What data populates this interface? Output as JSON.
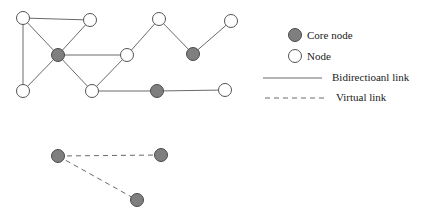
{
  "diagram": {
    "colors": {
      "core_fill": "#7f7f7f",
      "core_stroke": "#4a4a4a",
      "node_fill": "#ffffff",
      "node_stroke": "#555555",
      "link": "#6a6a6a"
    },
    "nodes": [
      {
        "id": "n1",
        "type": "node",
        "x": 23,
        "y": 18
      },
      {
        "id": "n2",
        "type": "node",
        "x": 90,
        "y": 20
      },
      {
        "id": "c1",
        "type": "core",
        "x": 58,
        "y": 55
      },
      {
        "id": "n3",
        "type": "node",
        "x": 23,
        "y": 91
      },
      {
        "id": "n4",
        "type": "node",
        "x": 127,
        "y": 55
      },
      {
        "id": "n5",
        "type": "node",
        "x": 92,
        "y": 91
      },
      {
        "id": "c2",
        "type": "core",
        "x": 157,
        "y": 91
      },
      {
        "id": "n6",
        "type": "node",
        "x": 225,
        "y": 90
      },
      {
        "id": "n7",
        "type": "node",
        "x": 159,
        "y": 19
      },
      {
        "id": "c3",
        "type": "core",
        "x": 193,
        "y": 54
      },
      {
        "id": "n8",
        "type": "node",
        "x": 231,
        "y": 21
      },
      {
        "id": "v1",
        "type": "core",
        "x": 58,
        "y": 156
      },
      {
        "id": "v2",
        "type": "core",
        "x": 161,
        "y": 155
      },
      {
        "id": "v3",
        "type": "core",
        "x": 137,
        "y": 200
      }
    ],
    "bidirectional_links": [
      [
        "n1",
        "n2"
      ],
      [
        "n1",
        "n3"
      ],
      [
        "n1",
        "c1"
      ],
      [
        "n2",
        "c1"
      ],
      [
        "n3",
        "c1"
      ],
      [
        "c1",
        "n4"
      ],
      [
        "c1",
        "n5"
      ],
      [
        "n5",
        "n4"
      ],
      [
        "n4",
        "n7"
      ],
      [
        "n7",
        "c3"
      ],
      [
        "c3",
        "n8"
      ],
      [
        "n5",
        "c2"
      ],
      [
        "c2",
        "n6"
      ]
    ],
    "virtual_links": [
      [
        "v1",
        "v2"
      ],
      [
        "v1",
        "v3"
      ]
    ]
  },
  "legend": {
    "core_node_label": "Core node",
    "node_label": "Node",
    "bidirectional_link_label": "Bidirectioanl link",
    "virtual_link_label": "Virtual link"
  }
}
